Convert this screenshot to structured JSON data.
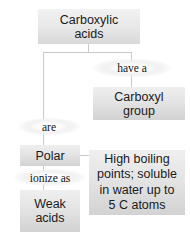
{
  "diagram": {
    "type": "concept-map",
    "colors": {
      "box_fill_light": "#efefef",
      "box_fill_dark": "#d2d2d2",
      "text": "#1b1b1b",
      "line": "#c9c9c9",
      "background": "#ffffff"
    },
    "nodes": {
      "root": {
        "label_line1": "Carboxylic",
        "label_line2": "acids"
      },
      "carboxyl_group": {
        "label_line1": "Carboxyl",
        "label_line2": "group"
      },
      "polar": {
        "label": "Polar"
      },
      "weak_acids": {
        "label_line1": "Weak",
        "label_line2": "acids"
      },
      "high_boiling": {
        "label_line1": "High boiling",
        "label_line2": "points; soluble",
        "label_line3": "in water up to",
        "label_line4": "5 C atoms"
      }
    },
    "connectors": {
      "have_a": {
        "label": "have a"
      },
      "are": {
        "label": "are"
      },
      "ionize_as": {
        "label": "ionize as"
      }
    }
  }
}
